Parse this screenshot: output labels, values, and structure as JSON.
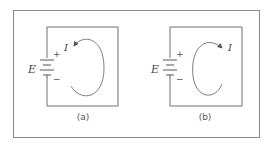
{
  "figure": {
    "panels": [
      {
        "id": "a",
        "caption": "(a)",
        "source_label": "E",
        "current_label": "I",
        "plus": "+",
        "minus": "−",
        "current_direction": "counterclockwise"
      },
      {
        "id": "b",
        "caption": "(b)",
        "source_label": "E",
        "current_label": "I",
        "plus": "+",
        "minus": "−",
        "current_direction": "clockwise"
      }
    ],
    "colors": {
      "line": "#6e6e6e",
      "frame": "#8a8a8a",
      "text": "#555555"
    }
  }
}
